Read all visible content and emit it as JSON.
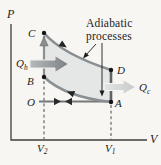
{
  "labels": {
    "pressure_axis": "P",
    "volume_axis": "V",
    "point_c": "C",
    "point_b": "B",
    "point_o": "O",
    "point_a": "A",
    "point_d": "D",
    "v2": {
      "base": "V",
      "sub": "2"
    },
    "v1": {
      "base": "V",
      "sub": "1"
    },
    "q_hot": {
      "base": "Q",
      "sub": "h"
    },
    "q_cold": {
      "base": "Q",
      "sub": "c"
    },
    "annotation_line1": "Adiabatic",
    "annotation_line2": "processes"
  },
  "colors": {
    "paper": "#f7f6f2",
    "cycle_shade": "#e4e7e6",
    "process_curve": "#8a8f92",
    "dark_segment": "#5f6366",
    "intake_line": "#75797c",
    "q_hot_arrow_light": "#b6babb",
    "q_hot_arrow_dark": "#7c8184",
    "q_cold_arrow_light": "#e3e5e4",
    "q_cold_arrow_dark": "#c7cac9",
    "ink": "#1c1c1c"
  }
}
